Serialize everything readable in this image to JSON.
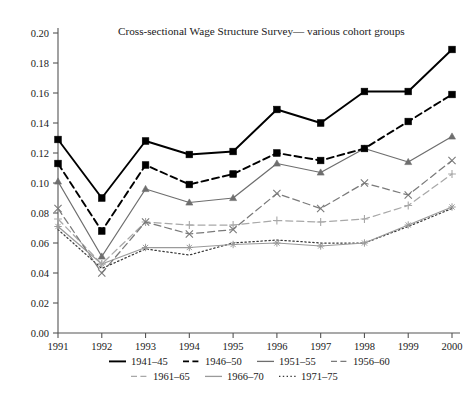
{
  "chart_data": {
    "type": "line",
    "title": "Cross-sectional Wage Structure Survey— various cohort groups",
    "xlabel": "",
    "ylabel": "",
    "x": [
      1991,
      1992,
      1993,
      1994,
      1995,
      1996,
      1997,
      1998,
      1999,
      2000
    ],
    "categories": [
      "1991",
      "1992",
      "1993",
      "1994",
      "1995",
      "1996",
      "1997",
      "1998",
      "1999",
      "2000"
    ],
    "xlim": [
      1991,
      2000
    ],
    "ylim": [
      0.0,
      0.2
    ],
    "yticks": [
      0.0,
      0.02,
      0.04,
      0.06,
      0.08,
      0.1,
      0.12,
      0.14,
      0.16,
      0.18,
      0.2
    ],
    "ytick_labels": [
      "0.00",
      "0.02",
      "0.04",
      "0.06",
      "0.08",
      "0.10",
      "0.12",
      "0.14",
      "0.16",
      "0.18",
      "0.20"
    ],
    "grid": false,
    "legend_position": "below-axis",
    "series": [
      {
        "name": "1941–45",
        "color": "#000000",
        "line_style": "solid",
        "marker": "square",
        "values": [
          0.129,
          0.09,
          0.128,
          0.119,
          0.121,
          0.149,
          0.14,
          0.161,
          0.161,
          0.189
        ]
      },
      {
        "name": "1946–50",
        "color": "#000000",
        "line_style": "dashed",
        "marker": "square",
        "values": [
          0.113,
          0.068,
          0.112,
          0.099,
          0.106,
          0.12,
          0.115,
          0.123,
          0.141,
          0.159
        ]
      },
      {
        "name": "1951–55",
        "color": "#6e6e6e",
        "line_style": "solid",
        "marker": "triangle",
        "values": [
          0.101,
          0.051,
          0.096,
          0.087,
          0.09,
          0.113,
          0.107,
          0.123,
          0.114,
          0.131
        ]
      },
      {
        "name": "1956–60",
        "color": "#7a7a7a",
        "line_style": "dashed",
        "marker": "cross",
        "values": [
          0.083,
          0.04,
          0.074,
          0.066,
          0.069,
          0.093,
          0.083,
          0.1,
          0.092,
          0.115
        ]
      },
      {
        "name": "1961–65",
        "color": "#a8a8a8",
        "line_style": "dashed",
        "marker": "plus",
        "values": [
          0.076,
          0.046,
          0.074,
          0.072,
          0.072,
          0.075,
          0.074,
          0.076,
          0.085,
          0.106
        ]
      },
      {
        "name": "1966–70",
        "color": "#9a9a9a",
        "line_style": "solid",
        "marker": "asterisk",
        "values": [
          0.071,
          0.046,
          0.057,
          0.057,
          0.059,
          0.06,
          0.058,
          0.06,
          0.072,
          0.084
        ]
      },
      {
        "name": "1971–75",
        "color": "#3a3a3a",
        "line_style": "dotted",
        "marker": "none",
        "values": [
          0.069,
          0.043,
          0.056,
          0.052,
          0.06,
          0.062,
          0.06,
          0.06,
          0.071,
          0.083
        ]
      }
    ]
  },
  "legend": {
    "rows": [
      [
        "1941–45",
        "1946–50",
        "1951–55",
        "1956–60"
      ],
      [
        "1961–65",
        "1966–70",
        "1971–75"
      ]
    ]
  }
}
